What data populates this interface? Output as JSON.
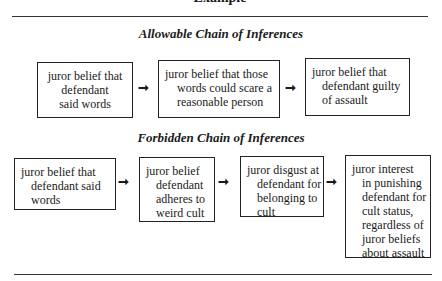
{
  "cut_title": "Example",
  "allowable": {
    "heading": "Allowable Chain of Inferences",
    "boxes": [
      {
        "lines": [
          "juror belief that",
          "defendant",
          "said words"
        ]
      },
      {
        "lines": [
          "juror belief that those",
          "words could scare a",
          "reasonable person"
        ]
      },
      {
        "lines": [
          "juror belief that",
          "defendant guilty",
          "of assault"
        ]
      }
    ]
  },
  "forbidden": {
    "heading": "Forbidden Chain of Inferences",
    "boxes": [
      {
        "lines": [
          "juror belief that",
          "defendant said",
          "words"
        ]
      },
      {
        "lines": [
          "juror belief",
          "defendant",
          "adheres to",
          "weird cult"
        ]
      },
      {
        "lines": [
          "juror disgust at",
          "defendant for",
          "belonging to",
          "cult"
        ]
      },
      {
        "lines": [
          "juror interest",
          "in punishing",
          "defendant for",
          "cult status,",
          "regardless of",
          "juror beliefs",
          "about assault"
        ]
      }
    ]
  },
  "arrow_glyph": "➞"
}
